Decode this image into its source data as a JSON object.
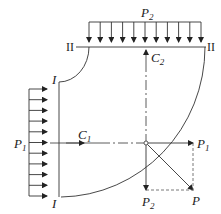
{
  "diagram": {
    "type": "force-diagram",
    "labels": {
      "P2_top": {
        "main": "P",
        "sub": "2"
      },
      "section_II_left": "II",
      "section_II_right": "II",
      "section_I_top": "I",
      "section_I_bottom": "I",
      "C2": {
        "main": "C",
        "sub": "2"
      },
      "C1": {
        "main": "C",
        "sub": "1"
      },
      "P1_left": {
        "main": "P",
        "sub": "1"
      },
      "P1_right": {
        "main": "P",
        "sub": "1"
      },
      "P2_bottom": {
        "main": "P",
        "sub": "2"
      },
      "P_resultant": "P"
    },
    "top_load_arrow_count": 11,
    "left_load_arrow_count": 11,
    "colors": {
      "line": "#333333",
      "dashed": "#555555"
    }
  }
}
